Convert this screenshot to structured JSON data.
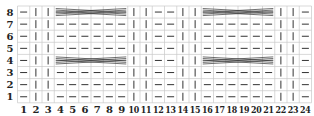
{
  "chart_data": {
    "type": "table",
    "title": "",
    "columns": 24,
    "rows": 8,
    "column_labels": [
      "1",
      "2",
      "3",
      "4",
      "5",
      "6",
      "7",
      "8",
      "9",
      "10",
      "11",
      "12",
      "13",
      "14",
      "15",
      "16",
      "17",
      "18",
      "19",
      "20",
      "21",
      "22",
      "23",
      "24"
    ],
    "row_labels": [
      "8",
      "7",
      "6",
      "5",
      "4",
      "3",
      "2",
      "1"
    ],
    "legend": {
      "dash": "purl",
      "bar": "knit",
      "cable": "cable cross"
    },
    "row_pattern_plain": [
      "dash",
      "bar",
      "bar",
      "dash",
      "dash",
      "dash",
      "dash",
      "dash",
      "dash",
      "bar",
      "bar",
      "dash",
      "dash",
      "bar",
      "bar",
      "dash",
      "dash",
      "dash",
      "dash",
      "dash",
      "dash",
      "bar",
      "bar",
      "dash"
    ],
    "cables": [
      {
        "row": 8,
        "from_col": 4,
        "to_col": 9
      },
      {
        "row": 8,
        "from_col": 16,
        "to_col": 21
      },
      {
        "row": 4,
        "from_col": 4,
        "to_col": 9
      },
      {
        "row": 4,
        "from_col": 16,
        "to_col": 21
      }
    ]
  },
  "grid": {
    "left": 17.5,
    "top": 6,
    "cell_w": 12.25,
    "cell_h": 12.1,
    "colors": {
      "grid": "#c8c8c8",
      "symbol": "#333333",
      "label": "#222222"
    }
  }
}
